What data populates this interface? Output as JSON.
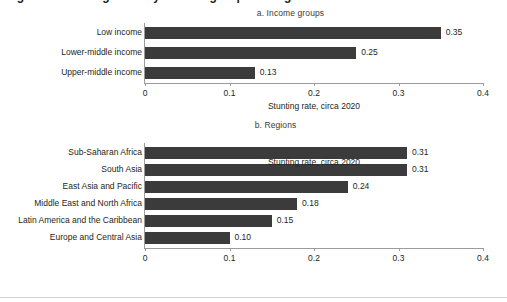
{
  "figure": {
    "clipped_heading": "Figure 1. Stunting rates by income group and region",
    "axis_title": "Stunting rate, circa 2020",
    "bar_color": "#3B3B3B",
    "axis_color": "#9B9B9B",
    "background": "#FFFFFF"
  },
  "panels": [
    {
      "id": "a",
      "title": "a. Income groups"
    },
    {
      "id": "b",
      "title": "b. Regions"
    }
  ],
  "ticks": {
    "labels": [
      "0",
      "0.1",
      "0.2",
      "0.3",
      "0.4"
    ],
    "values": [
      0,
      0.1,
      0.2,
      0.3,
      0.4
    ]
  },
  "panel_a": {
    "categories": [
      "Low income",
      "Lower-middle income",
      "Upper-middle income"
    ],
    "values": [
      0.35,
      0.25,
      0.13
    ],
    "value_labels": [
      "0.35",
      "0.25",
      "0.13"
    ]
  },
  "panel_b": {
    "categories": [
      "Sub-Saharan Africa",
      "South Asia",
      "East Asia and Pacific",
      "Middle East and North Africa",
      "Latin America and the Caribbean",
      "Europe and Central Asia"
    ],
    "values": [
      0.31,
      0.31,
      0.24,
      0.18,
      0.15,
      0.1
    ],
    "value_labels": [
      "0.31",
      "0.31",
      "0.24",
      "0.18",
      "0.15",
      "0.10"
    ]
  },
  "chart_data": [
    {
      "type": "bar",
      "orientation": "horizontal",
      "title": "a. Income groups",
      "categories": [
        "Low income",
        "Lower-middle income",
        "Upper-middle income"
      ],
      "values": [
        0.35,
        0.25,
        0.13
      ],
      "data_labels": [
        "0.35",
        "0.25",
        "0.13"
      ],
      "xlabel": "Stunting rate, circa 2020",
      "ylabel": "",
      "xlim": [
        0,
        0.4
      ],
      "xticks": [
        0,
        0.1,
        0.2,
        0.3,
        0.4
      ],
      "xticklabels": [
        "0",
        "0.1",
        "0.2",
        "0.3",
        "0.4"
      ],
      "grid": false,
      "legend": false,
      "bar_color": "#3B3B3B"
    },
    {
      "type": "bar",
      "orientation": "horizontal",
      "title": "b. Regions",
      "categories": [
        "Sub-Saharan Africa",
        "South Asia",
        "East Asia and Pacific",
        "Middle East and North Africa",
        "Latin America and the Caribbean",
        "Europe and Central Asia"
      ],
      "values": [
        0.31,
        0.31,
        0.24,
        0.18,
        0.15,
        0.1
      ],
      "data_labels": [
        "0.31",
        "0.31",
        "0.24",
        "0.18",
        "0.15",
        "0.10"
      ],
      "xlabel": "Stunting rate, circa 2020",
      "ylabel": "",
      "xlim": [
        0,
        0.4
      ],
      "xticks": [
        0,
        0.1,
        0.2,
        0.3,
        0.4
      ],
      "xticklabels": [
        "0",
        "0.1",
        "0.2",
        "0.3",
        "0.4"
      ],
      "grid": false,
      "legend": false,
      "bar_color": "#3B3B3B"
    }
  ]
}
